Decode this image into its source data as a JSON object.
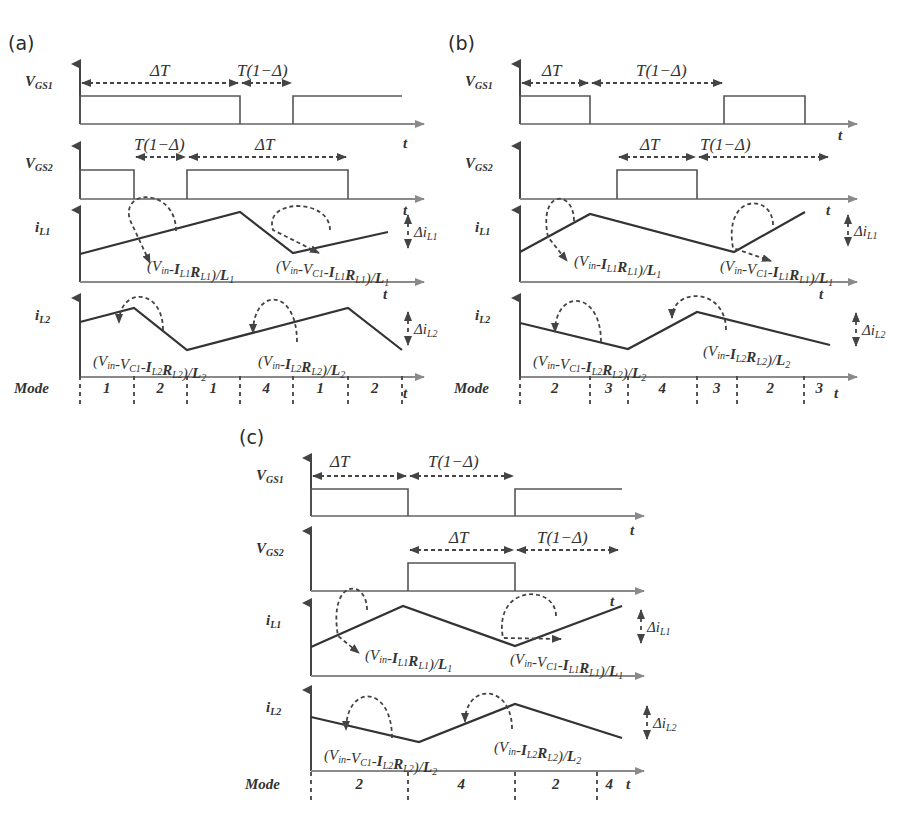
{
  "figure": {
    "panels": [
      {
        "id": "a",
        "label": "(a)",
        "origin_x": 80,
        "end_x": 402,
        "signals": {
          "vgs1": {
            "name": "V",
            "sub": "GS1",
            "baseline_y": 124,
            "high_y": 96,
            "axis_top": 64,
            "pulses": [
              [
                80,
                240
              ],
              [
                293,
                402
              ]
            ],
            "intervals": [
              {
                "label": "ΔT",
                "x1": 80,
                "x2": 240,
                "y": 83,
                "text_x": 150,
                "text_y": 76
              },
              {
                "label": "T(1−Δ)",
                "x1": 240,
                "x2": 293,
                "y": 83,
                "text_x": 237,
                "text_y": 76
              }
            ]
          },
          "vgs2": {
            "name": "V",
            "sub": "GS2",
            "baseline_y": 199,
            "high_y": 170,
            "axis_top": 146,
            "pulses": [
              [
                80,
                134
              ],
              [
                187,
                348
              ]
            ],
            "intervals": [
              {
                "label": "T(1−Δ)",
                "x1": 134,
                "x2": 187,
                "y": 157,
                "text_x": 134,
                "text_y": 150
              },
              {
                "label": "ΔT",
                "x1": 187,
                "x2": 348,
                "y": 157,
                "text_x": 255,
                "text_y": 150
              }
            ]
          },
          "il1": {
            "name": "i",
            "sub": "L1",
            "axis_top": 210,
            "baseline_y": 282,
            "points": [
              [
                80,
                254
              ],
              [
                240,
                212
              ],
              [
                293,
                253
              ],
              [
                388,
                232
              ]
            ],
            "delta": {
              "label": "Δi",
              "sub": "L1",
              "x": 408,
              "y1": 213,
              "y2": 250
            },
            "formulas": [
              {
                "text": "(V",
                "full": "(Vin-IL1RL1)/L1",
                "x": 147,
                "y": 271,
                "arc": [
                  130,
                  220,
                  176,
                  231,
                  150,
                  263
                ]
              },
              {
                "full": "(Vin-VC1-IL1RL1)/L1",
                "x": 276,
                "y": 271,
                "arc": [
                  273,
                  230,
                  330,
                  230,
                  319,
                  253
                ]
              }
            ]
          },
          "il2": {
            "name": "i",
            "sub": "L2",
            "axis_top": 298,
            "baseline_y": 377,
            "points": [
              [
                80,
                322
              ],
              [
                134,
                308
              ],
              [
                187,
                350
              ],
              [
                348,
                308
              ],
              [
                402,
                350
              ]
            ],
            "delta": {
              "label": "Δi",
              "sub": "L2",
              "x": 408,
              "y1": 310,
              "y2": 347
            },
            "formulas": [
              {
                "full": "(Vin-VC1-IL2RL2)/L2",
                "x": 93,
                "y": 366,
                "arc": [
                  119,
                  323,
                  163,
                  330,
                  147,
                  297
                ]
              },
              {
                "full": "(Vin-IL2RL2)/L2",
                "x": 258,
                "y": 366,
                "arc": [
                  253,
                  333,
                  297,
                  342,
                  274,
                  297
                ]
              }
            ]
          },
          "mode": {
            "label": "Mode",
            "y": 393,
            "dividers": [
              80,
              134,
              187,
              240,
              293,
              348,
              402
            ],
            "values": [
              "1",
              "2",
              "1",
              "4",
              "1",
              "2"
            ]
          }
        },
        "t_labels": [
          [
            403,
            148
          ],
          [
            403,
            215
          ],
          [
            383,
            299
          ],
          [
            403,
            398
          ]
        ]
      },
      {
        "id": "b",
        "label": "(b)",
        "origin_x": 520,
        "end_x": 835,
        "signals": {
          "vgs1": {
            "name": "V",
            "sub": "GS1",
            "baseline_y": 124,
            "high_y": 96,
            "axis_top": 64,
            "pulses": [
              [
                520,
                590
              ],
              [
                724,
                805
              ]
            ],
            "intervals": [
              {
                "label": "ΔT",
                "x1": 520,
                "x2": 590,
                "y": 83,
                "text_x": 542,
                "text_y": 76
              },
              {
                "label": "T(1−Δ)",
                "x1": 590,
                "x2": 724,
                "y": 83,
                "text_x": 636,
                "text_y": 76
              }
            ]
          },
          "vgs2": {
            "name": "V",
            "sub": "GS2",
            "baseline_y": 199,
            "high_y": 170,
            "axis_top": 146,
            "pulses": [
              [
                617,
                697
              ]
            ],
            "intervals": [
              {
                "label": "ΔT",
                "x1": 617,
                "x2": 697,
                "y": 157,
                "text_x": 640,
                "text_y": 150
              },
              {
                "label": "T(1−Δ)",
                "x1": 697,
                "x2": 830,
                "y": 157,
                "text_x": 700,
                "text_y": 150
              }
            ]
          },
          "il1": {
            "name": "i",
            "sub": "L1",
            "axis_top": 210,
            "baseline_y": 282,
            "points": [
              [
                520,
                252
              ],
              [
                590,
                214
              ],
              [
                734,
                252
              ],
              [
                805,
                212
              ]
            ],
            "delta": {
              "label": "Δi",
              "sub": "L1",
              "x": 848,
              "y1": 213,
              "y2": 248
            },
            "formulas": [
              {
                "full": "(Vin-IL1RL1)/L1",
                "x": 574,
                "y": 266,
                "arc": [
                  548,
                  237,
                  574,
                  221,
                  567,
                  261
                ]
              },
              {
                "full": "(Vin-VC1-IL1RL1)/L1",
                "x": 720,
                "y": 271,
                "arc": [
                  733,
                  248,
                  773,
                  225,
                  771,
                  261
                ]
              }
            ]
          },
          "mode": {
            "label": "Mode",
            "y": 393,
            "dividers": [
              520,
              590,
              628,
              697,
              737,
              804
            ],
            "values": [
              "2",
              "3",
              "4",
              "3",
              "2",
              "3"
            ]
          },
          "il2": {
            "name": "i",
            "sub": "L2",
            "axis_top": 298,
            "baseline_y": 377,
            "points": [
              [
                520,
                323
              ],
              [
                628,
                349
              ],
              [
                697,
                312
              ],
              [
                830,
                345
              ]
            ],
            "delta": {
              "label": "Δi",
              "sub": "L2",
              "x": 856,
              "y1": 311,
              "y2": 348
            },
            "formulas": [
              {
                "full": "(Vin-VC1-IL2RL2)/L2",
                "x": 533,
                "y": 366,
                "arc": [
                  555,
                  332,
                  601,
                  342,
                  578,
                  299
                ]
              },
              {
                "full": "(Vin-IL2RL2)/L2",
                "x": 703,
                "y": 356,
                "arc": [
                  672,
                  318,
                  726,
                  330,
                  700,
                  297
                ]
              }
            ]
          }
        },
        "t_labels": [
          [
            838,
            140
          ],
          [
            826,
            215
          ],
          [
            819,
            299
          ],
          [
            834,
            398
          ]
        ]
      },
      {
        "id": "c",
        "label": "(c)",
        "origin_x": 311,
        "end_x": 622,
        "signals": {
          "vgs1": {
            "name": "V",
            "sub": "GS1",
            "baseline_y": 516,
            "high_y": 489,
            "axis_top": 458,
            "pulses": [
              [
                311,
                408
              ],
              [
                515,
                622
              ]
            ],
            "intervals": [
              {
                "label": "ΔT",
                "x1": 311,
                "x2": 408,
                "y": 476,
                "text_x": 330,
                "text_y": 467
              },
              {
                "label": "T(1−Δ)",
                "x1": 408,
                "x2": 515,
                "y": 476,
                "text_x": 428,
                "text_y": 467
              }
            ]
          },
          "vgs2": {
            "name": "V",
            "sub": "GS2",
            "baseline_y": 591,
            "high_y": 563,
            "axis_top": 531,
            "pulses": [
              [
                408,
                515
              ]
            ],
            "intervals": [
              {
                "label": "ΔT",
                "x1": 408,
                "x2": 515,
                "y": 550,
                "text_x": 449,
                "text_y": 543
              },
              {
                "label": "T(1−Δ)",
                "x1": 515,
                "x2": 620,
                "y": 550,
                "text_x": 537,
                "text_y": 543
              }
            ]
          },
          "il1": {
            "name": "i",
            "sub": "L1",
            "axis_top": 603,
            "baseline_y": 676,
            "points": [
              [
                311,
                647
              ],
              [
                403,
                606
              ],
              [
                515,
                646
              ],
              [
                622,
                606
              ]
            ],
            "delta": {
              "label": "Δi",
              "sub": "L1",
              "x": 641,
              "y1": 608,
              "y2": 645
            },
            "formulas": [
              {
                "full": "(Vin-IL1RL1)/L1",
                "x": 365,
                "y": 660,
                "arc": [
                  338,
                  636,
                  367,
                  610,
                  359,
                  653
                ]
              },
              {
                "full": "(Vin-VC1-IL1RL1)/L1",
                "x": 510,
                "y": 664,
                "arc": [
                  503,
                  638,
                  556,
                  616,
                  561,
                  639
                ]
              }
            ]
          },
          "il2": {
            "name": "i",
            "sub": "L2",
            "axis_top": 690,
            "baseline_y": 771,
            "points": [
              [
                311,
                717
              ],
              [
                419,
                742
              ],
              [
                515,
                704
              ],
              [
                622,
                738
              ]
            ],
            "delta": {
              "label": "Δi",
              "sub": "L2",
              "x": 647,
              "y1": 704,
              "y2": 741
            },
            "formulas": [
              {
                "full": "(Vin-VC1-IL2RL2)/L2",
                "x": 324,
                "y": 760,
                "arc": [
                  346,
                  730,
                  392,
                  738,
                  368,
                  694
                ]
              },
              {
                "full": "(Vin-IL2RL2)/L2",
                "x": 494,
                "y": 752,
                "arc": [
                  465,
                  722,
                  512,
                  729,
                  490,
                  693
                ]
              }
            ]
          },
          "mode": {
            "label": "Mode",
            "y": 789,
            "dividers": [
              311,
              408,
              515,
              597
            ],
            "values": [
              "2",
              "4",
              "2",
              "4"
            ]
          }
        },
        "t_labels": [
          [
            630,
            535
          ],
          [
            610,
            606
          ],
          [
            626,
            789
          ]
        ]
      }
    ],
    "common_text": {
      "t": "t",
      "in": "in",
      "c1": "C1"
    }
  }
}
